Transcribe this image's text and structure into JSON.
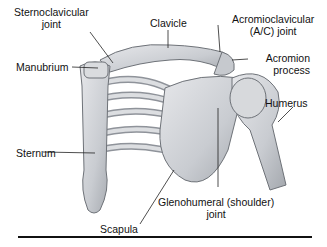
{
  "figure": {
    "labels": {
      "sternoclavicular": [
        "Sternoclavicular",
        "joint"
      ],
      "clavicle": "Clavicle",
      "acromioclavicular": [
        "Acromioclavicular",
        "(A/C) joint"
      ],
      "manubrium": "Manubrium",
      "acromion": [
        "Acromion",
        "process"
      ],
      "humerus": "Humerus",
      "sternum": "Sternum",
      "glenohumeral": [
        "Glenohumeral (shoulder)",
        "joint"
      ],
      "scapula": "Scapula"
    },
    "colors": {
      "bone_fill": "#d2d4d8",
      "bone_shadow": "#9a9ea5",
      "bone_outline": "#6e7278",
      "leader_line": "#222222",
      "text": "#111111"
    }
  }
}
